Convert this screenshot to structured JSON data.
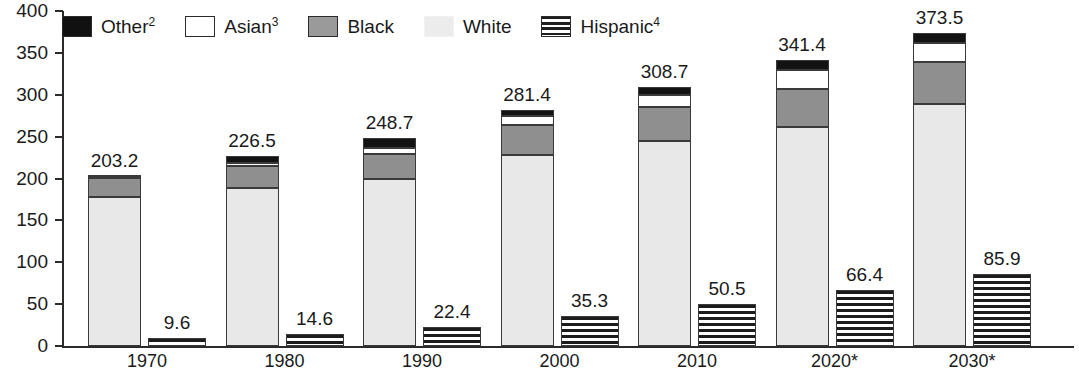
{
  "chart_data": {
    "type": "bar",
    "title": "",
    "xlabel": "",
    "ylabel": "",
    "ylim": [
      0,
      400
    ],
    "ytick_step": 50,
    "yticks": [
      "400",
      "350",
      "300",
      "250",
      "200",
      "150",
      "100",
      "50",
      "0"
    ],
    "grid": false,
    "legend_position": "top-left",
    "categories": [
      "1970",
      "1980",
      "1990",
      "2000",
      "2010",
      "2020*",
      "2030*"
    ],
    "stack_order_bottom_to_top": [
      "White",
      "Black",
      "Asian",
      "Other"
    ],
    "series": [
      {
        "name": "White",
        "values": [
          177.6,
          188.4,
          199.7,
          228.5,
          244.7,
          261.5,
          288.4
        ]
      },
      {
        "name": "Black",
        "values": [
          22.6,
          26.5,
          30.0,
          35.8,
          41.1,
          45.4,
          50.4
        ]
      },
      {
        "name": "Asian",
        "values": [
          1.4,
          3.5,
          7.3,
          10.7,
          14.4,
          22.6,
          22.9
        ]
      },
      {
        "name": "Other",
        "values": [
          1.6,
          8.1,
          11.7,
          6.4,
          8.5,
          11.9,
          11.8
        ]
      },
      {
        "name": "Hispanic",
        "values": [
          9.6,
          14.6,
          22.4,
          35.3,
          50.5,
          66.4,
          85.9
        ]
      }
    ],
    "totals": [
      203.2,
      226.5,
      248.7,
      281.4,
      308.7,
      341.4,
      373.5
    ],
    "total_labels": [
      "203.2",
      "226.5",
      "248.7",
      "281.4",
      "308.7",
      "341.4",
      "373.5"
    ],
    "hispanic_labels": [
      "9.6",
      "14.6",
      "22.4",
      "35.3",
      "50.5",
      "66.4",
      "85.9"
    ],
    "colors": {
      "Other": "#131313",
      "Asian": "#ffffff",
      "Black": "#8f8f8f",
      "White": "#e8e8e8",
      "Hispanic": "#1c1c1c",
      "axis": "#2b2b2b",
      "text": "#1a1a1a"
    }
  },
  "legend": {
    "items": [
      {
        "label": "Other",
        "sup": "2",
        "swatch": "other-swatch"
      },
      {
        "label": "Asian",
        "sup": "3",
        "swatch": "asian-swatch"
      },
      {
        "label": "Black",
        "sup": "",
        "swatch": "black-swatch"
      },
      {
        "label": "White",
        "sup": "",
        "swatch": "white-swatch"
      },
      {
        "label": "Hispanic",
        "sup": "4",
        "swatch": "hispanic-swatch"
      }
    ]
  },
  "axis": {
    "y_tick_labels": [
      "400",
      "350",
      "300",
      "250",
      "200",
      "150",
      "100",
      "50",
      "0"
    ],
    "x_tick_labels": [
      "1970",
      "1980",
      "1990",
      "2000",
      "2010",
      "2020*",
      "2030*"
    ]
  }
}
